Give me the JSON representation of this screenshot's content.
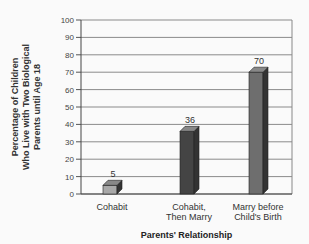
{
  "chart_data": {
    "type": "bar",
    "title": "",
    "xlabel": "Parents' Relationship",
    "ylabel": "Percentage of Children\nWho Live with Two Biological\nParents until Age 18",
    "categories": [
      "Cohabit",
      "Cohabit, Then Marry",
      "Marry before Child's Birth"
    ],
    "category_lines": [
      [
        "Cohabit"
      ],
      [
        "Cohabit,",
        "Then Marry"
      ],
      [
        "Marry before",
        "Child's Birth"
      ]
    ],
    "values": [
      5,
      36,
      70
    ],
    "data_labels": [
      "5",
      "36",
      "70"
    ],
    "ylim": [
      0,
      100
    ],
    "yticks": [
      0,
      10,
      20,
      30,
      40,
      50,
      60,
      70,
      80,
      90,
      100
    ],
    "grid": true,
    "legend": null,
    "bar_colors": [
      "#a8a8a8",
      "#444444",
      "#6e6e6e"
    ],
    "style": "3d-bar"
  }
}
